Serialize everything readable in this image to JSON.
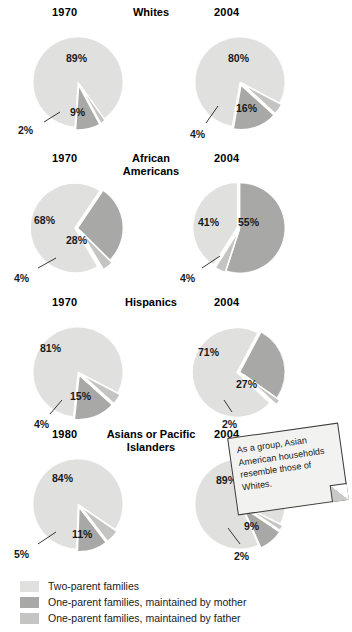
{
  "colors": {
    "two_parent": "#e0e0de",
    "mother": "#a8a8a6",
    "father": "#c4c4c2",
    "outline": "#ffffff",
    "text": "#1a1a1a",
    "note_bg": "#f2f2f0",
    "note_border": "#3a3a3a"
  },
  "note": {
    "text": "As a group, Asian American households resemble those of Whites."
  },
  "legend": {
    "items": [
      {
        "label": "Two-parent families",
        "color_key": "two_parent"
      },
      {
        "label": "One-parent families, maintained by mother",
        "color_key": "mother"
      },
      {
        "label": "One-parent families, maintained by father",
        "color_key": "father"
      }
    ]
  },
  "chart_data": {
    "type": "pie",
    "title": "",
    "legend_position": "bottom-left",
    "series_names": [
      "Two-parent families",
      "One-parent families, maintained by mother",
      "One-parent families, maintained by father"
    ],
    "groups": [
      {
        "name": "Whites",
        "title_lines": [
          "Whites"
        ],
        "charts": [
          {
            "year": "1970",
            "labels": [
              "89%",
              "9%",
              "2%"
            ],
            "values": [
              89,
              9,
              2
            ],
            "slices": [
              {
                "label": "89%",
                "value": 89,
                "series": "Two-parent families"
              },
              {
                "label": "9%",
                "value": 9,
                "series": "One-parent families, maintained by mother"
              },
              {
                "label": "2%",
                "value": 2,
                "series": "One-parent families, maintained by father"
              }
            ]
          },
          {
            "year": "2004",
            "labels": [
              "80%",
              "16%",
              "4%"
            ],
            "values": [
              80,
              16,
              4
            ],
            "slices": [
              {
                "label": "80%",
                "value": 80,
                "series": "Two-parent families"
              },
              {
                "label": "16%",
                "value": 16,
                "series": "One-parent families, maintained by mother"
              },
              {
                "label": "4%",
                "value": 4,
                "series": "One-parent families, maintained by father"
              }
            ]
          }
        ]
      },
      {
        "name": "African Americans",
        "title_lines": [
          "African",
          "Americans"
        ],
        "charts": [
          {
            "year": "1970",
            "labels": [
              "68%",
              "28%",
              "4%"
            ],
            "values": [
              68,
              28,
              4
            ],
            "slices": [
              {
                "label": "68%",
                "value": 68,
                "series": "Two-parent families"
              },
              {
                "label": "28%",
                "value": 28,
                "series": "One-parent families, maintained by mother"
              },
              {
                "label": "4%",
                "value": 4,
                "series": "One-parent families, maintained by father"
              }
            ]
          },
          {
            "year": "2004",
            "labels": [
              "41%",
              "55%",
              "4%"
            ],
            "values": [
              41,
              55,
              4
            ],
            "slices": [
              {
                "label": "41%",
                "value": 41,
                "series": "Two-parent families"
              },
              {
                "label": "55%",
                "value": 55,
                "series": "One-parent families, maintained by mother"
              },
              {
                "label": "4%",
                "value": 4,
                "series": "One-parent families, maintained by father"
              }
            ]
          }
        ]
      },
      {
        "name": "Hispanics",
        "title_lines": [
          "Hispanics"
        ],
        "charts": [
          {
            "year": "1970",
            "labels": [
              "81%",
              "15%",
              "4%"
            ],
            "values": [
              81,
              15,
              4
            ],
            "slices": [
              {
                "label": "81%",
                "value": 81,
                "series": "Two-parent families"
              },
              {
                "label": "15%",
                "value": 15,
                "series": "One-parent families, maintained by mother"
              },
              {
                "label": "4%",
                "value": 4,
                "series": "One-parent families, maintained by father"
              }
            ]
          },
          {
            "year": "2004",
            "labels": [
              "71%",
              "27%",
              "2%"
            ],
            "values": [
              71,
              27,
              2
            ],
            "slices": [
              {
                "label": "71%",
                "value": 71,
                "series": "Two-parent families"
              },
              {
                "label": "27%",
                "value": 27,
                "series": "One-parent families, maintained by mother"
              },
              {
                "label": "2%",
                "value": 2,
                "series": "One-parent families, maintained by father"
              }
            ]
          }
        ]
      },
      {
        "name": "Asians or Pacific Islanders",
        "title_lines": [
          "Asians or Pacific",
          "Islanders"
        ],
        "charts": [
          {
            "year": "1980",
            "labels": [
              "84%",
              "11%",
              "5%"
            ],
            "values": [
              84,
              11,
              5
            ],
            "slices": [
              {
                "label": "84%",
                "value": 84,
                "series": "Two-parent families"
              },
              {
                "label": "11%",
                "value": 11,
                "series": "One-parent families, maintained by mother"
              },
              {
                "label": "5%",
                "value": 5,
                "series": "One-parent families, maintained by father"
              }
            ]
          },
          {
            "year": "2004",
            "labels": [
              "89%",
              "9%",
              "2%"
            ],
            "values": [
              89,
              9,
              2
            ],
            "slices": [
              {
                "label": "89%",
                "value": 89,
                "series": "Two-parent families"
              },
              {
                "label": "9%",
                "value": 9,
                "series": "One-parent families, maintained by mother"
              },
              {
                "label": "2%",
                "value": 2,
                "series": "One-parent families, maintained by father"
              }
            ]
          }
        ]
      }
    ]
  }
}
